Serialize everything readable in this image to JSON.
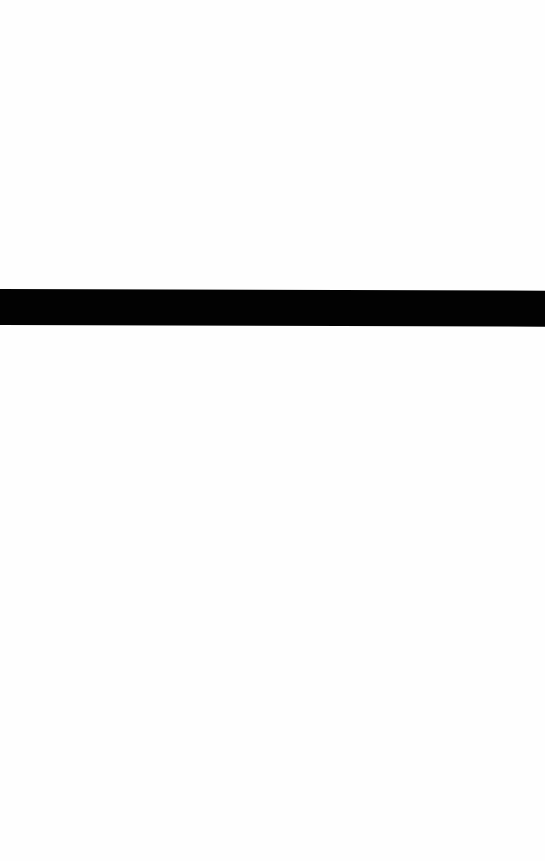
{
  "page": {
    "background_color": "#fefefe"
  },
  "bar": {
    "color": "#020202"
  }
}
